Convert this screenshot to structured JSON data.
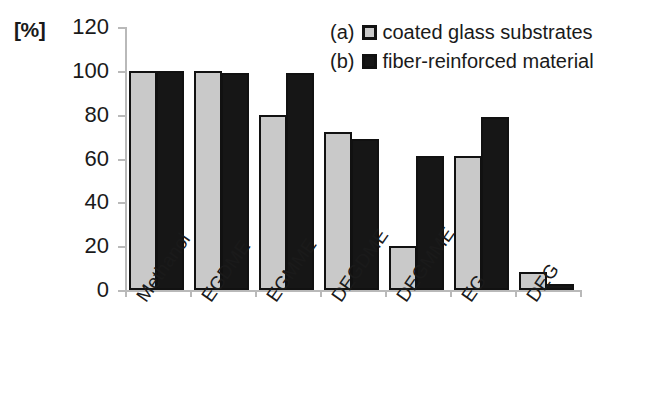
{
  "chart_data": {
    "type": "bar",
    "title": "",
    "subtitle": "",
    "xlabel": "",
    "ylabel": "[%]",
    "ylim": [
      0,
      120
    ],
    "ytick_step": 20,
    "yticks": [
      120,
      100,
      80,
      60,
      40,
      20,
      0
    ],
    "grid": false,
    "legend_position": "top-right",
    "categories": [
      "Methanol",
      "EGDME",
      "EGMME",
      "DEGDME",
      "DEGMME",
      "EG",
      "DEG"
    ],
    "series": [
      {
        "name": "coated glass substrates",
        "tag": "(a)",
        "color": "#c9c9c9",
        "values": [
          100,
          100,
          80,
          72,
          20,
          61,
          8
        ]
      },
      {
        "name": "fiber-reinforced material",
        "tag": "(b)",
        "color": "#161616",
        "values": [
          100,
          99,
          99,
          69,
          61,
          79,
          2
        ]
      }
    ]
  },
  "axis": {
    "unit_label": "[%]",
    "tick_labels": [
      "120",
      "100",
      "80",
      "60",
      "40",
      "20",
      "0"
    ],
    "category_labels": [
      "Methanol",
      "EGDME",
      "EGMME",
      "DEGDME",
      "DEGMME",
      "EG",
      "DEG"
    ]
  },
  "legend": {
    "rows": [
      {
        "tag": "(a)",
        "label": "coated glass substrates",
        "swatch": "series-a"
      },
      {
        "tag": "(b)",
        "label": "fiber-reinforced material",
        "swatch": "series-b"
      }
    ]
  },
  "colors": {
    "series_a_fill": "#c9c9c9",
    "series_b_fill": "#161616",
    "bar_border": "#111111",
    "axis": "#b9b9b9",
    "text": "#1a1a1a",
    "background": "#ffffff"
  }
}
